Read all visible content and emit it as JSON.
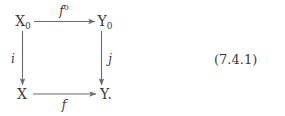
{
  "diagram": {
    "type": "commutative-square",
    "nodes": {
      "top_left": {
        "base": "X",
        "sub": "0"
      },
      "top_right": {
        "base": "Y",
        "sub": "0"
      },
      "bottom_left": {
        "base": "X",
        "sub": ""
      },
      "bottom_right": {
        "base": "Y",
        "sub": "",
        "trailing": "."
      }
    },
    "arrows": {
      "top": {
        "label_base": "f",
        "label_sup": "0",
        "direction": "right"
      },
      "left": {
        "label_base": "i",
        "label_sup": "",
        "direction": "down"
      },
      "right": {
        "label_base": "j",
        "label_sup": "",
        "direction": "down"
      },
      "bottom": {
        "label_base": "f",
        "label_sup": "",
        "direction": "right"
      }
    },
    "stroke_color": "#6b6b6b",
    "text_color": "#3a3a3a"
  },
  "equation": {
    "number": "(7.4.1)"
  },
  "page": {
    "background": "#ffffff"
  }
}
